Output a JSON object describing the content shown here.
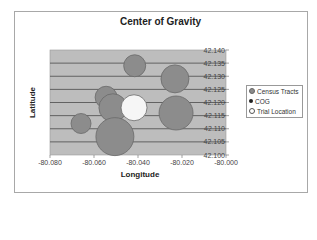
{
  "chart_data": {
    "type": "scatter",
    "subtype": "bubble",
    "title": "Center of Gravity",
    "xlabel": "Longitude",
    "ylabel": "Latitude",
    "xlim": [
      -80.08,
      -80.0
    ],
    "ylim": [
      42.1,
      42.14
    ],
    "x_ticks": [
      "-80.080",
      "-80.060",
      "-80.040",
      "-80.020",
      "-80.000"
    ],
    "y_ticks": [
      "42.100",
      "42.105",
      "42.110",
      "42.115",
      "42.120",
      "42.125",
      "42.130",
      "42.135",
      "42.140"
    ],
    "grid": {
      "horizontal": true,
      "vertical": false
    },
    "legend_position": "right",
    "legend": [
      "Census Tracts",
      "COG",
      "Trial Location"
    ],
    "series": [
      {
        "name": "Census Tracts",
        "color": "#8c8c8c",
        "points": [
          {
            "x": -80.0415,
            "y": 42.134,
            "size": 11
          },
          {
            "x": -80.0232,
            "y": 42.129,
            "size": 14
          },
          {
            "x": -80.0545,
            "y": 42.122,
            "size": 11
          },
          {
            "x": -80.0514,
            "y": 42.118,
            "size": 14
          },
          {
            "x": -80.0227,
            "y": 42.116,
            "size": 17
          },
          {
            "x": -80.0659,
            "y": 42.112,
            "size": 10
          },
          {
            "x": -80.0505,
            "y": 42.107,
            "size": 19
          }
        ]
      },
      {
        "name": "COG",
        "color": "#222222",
        "points": []
      },
      {
        "name": "Trial Location",
        "color": "#ffffff",
        "points": [
          {
            "x": -80.0418,
            "y": 42.118,
            "size": 13
          }
        ]
      }
    ]
  },
  "colors": {
    "plot_bg": "#bdbdbd",
    "gridline": "#4a4a4a",
    "bubble_fill": "#8c8c8c",
    "bubble_stroke": "#6a6a6a",
    "trial_fill": "#f6f6f6",
    "cog_marker": "#222222"
  }
}
